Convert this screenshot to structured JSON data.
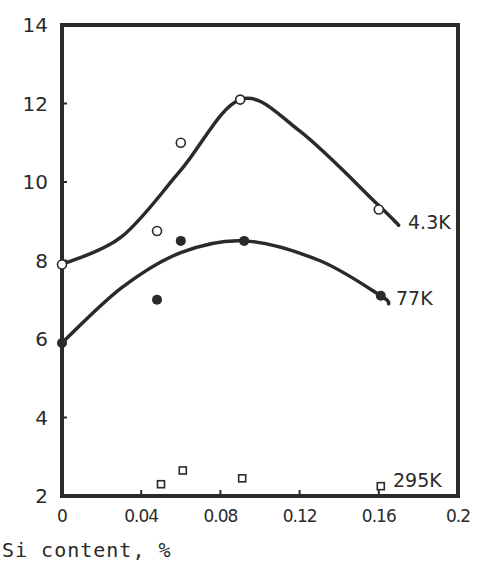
{
  "chart_data": {
    "type": "scatter",
    "title": "",
    "xlabel": "Si content, %",
    "ylabel": "",
    "xlim": [
      0,
      0.2
    ],
    "ylim": [
      2,
      14
    ],
    "grid": false,
    "x_ticks": [
      "0",
      "0.04",
      "0.08",
      "0.12",
      "0.16",
      "0.2"
    ],
    "y_ticks": [
      "2",
      "4",
      "6",
      "8",
      "10",
      "12",
      "14"
    ],
    "series": [
      {
        "name": "4.3K",
        "marker": "open-circle",
        "points": [
          [
            0,
            7.9
          ],
          [
            0.048,
            8.75
          ],
          [
            0.06,
            11.0
          ],
          [
            0.09,
            12.1
          ],
          [
            0.16,
            9.3
          ]
        ],
        "fit_curve": [
          [
            0,
            7.9
          ],
          [
            0.03,
            8.6
          ],
          [
            0.06,
            10.3
          ],
          [
            0.09,
            12.1
          ],
          [
            0.12,
            11.3
          ],
          [
            0.16,
            9.4
          ],
          [
            0.17,
            8.9
          ]
        ]
      },
      {
        "name": "77K",
        "marker": "filled-circle",
        "points": [
          [
            0,
            5.9
          ],
          [
            0.048,
            7.0
          ],
          [
            0.06,
            8.5
          ],
          [
            0.092,
            8.5
          ],
          [
            0.161,
            7.1
          ]
        ],
        "fit_curve": [
          [
            0,
            5.9
          ],
          [
            0.03,
            7.3
          ],
          [
            0.06,
            8.2
          ],
          [
            0.092,
            8.5
          ],
          [
            0.13,
            8.0
          ],
          [
            0.161,
            7.1
          ],
          [
            0.165,
            6.9
          ]
        ]
      },
      {
        "name": "295K",
        "marker": "open-square",
        "points": [
          [
            0.05,
            2.3
          ],
          [
            0.061,
            2.65
          ],
          [
            0.091,
            2.45
          ],
          [
            0.161,
            2.25
          ]
        ]
      }
    ]
  },
  "labels": {
    "x_axis": "Si content, %",
    "series_4_3k": "4.3K",
    "series_77k": "77K",
    "series_295k": "295K"
  }
}
